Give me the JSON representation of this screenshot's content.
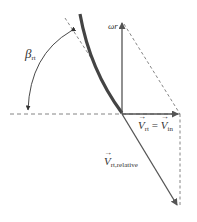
{
  "diagram": {
    "type": "velocity-triangle",
    "labels": {
      "beta": {
        "symbol": "β",
        "subscript": "rt"
      },
      "omega_r": "ωr",
      "v_rt": {
        "symbol": "V",
        "subscript": "rt"
      },
      "equals": "=",
      "v_in": {
        "symbol": "V",
        "subscript": "in"
      },
      "v_relative": {
        "symbol": "V",
        "subscript": "rt,relative"
      }
    },
    "colors": {
      "blade": "#444444",
      "vector": "#555555",
      "dashed": "#666666",
      "text": "#333333"
    }
  }
}
